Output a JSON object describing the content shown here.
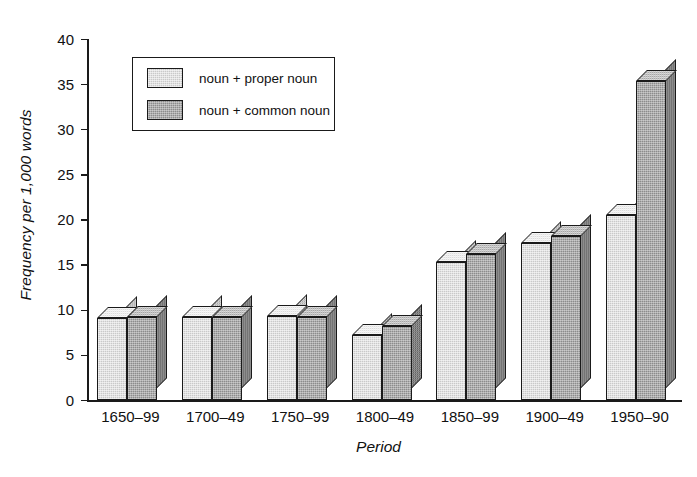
{
  "chart_data": {
    "type": "bar",
    "title": "",
    "xlabel": "Period",
    "ylabel": "Frequency per 1,000 words",
    "ylim": [
      0,
      40
    ],
    "yticks": [
      0,
      5,
      10,
      15,
      20,
      25,
      30,
      35,
      40
    ],
    "ytick_labels": [
      "0",
      "5",
      "10",
      "15",
      "20",
      "25",
      "30",
      "35",
      "40"
    ],
    "grid": false,
    "legend_position": "upper left",
    "categories": [
      "1650–99",
      "1700–49",
      "1750–99",
      "1800–49",
      "1850–99",
      "1900–49",
      "1950–90"
    ],
    "series": [
      {
        "name": "noun + proper noun",
        "color": "#c9c9c9",
        "values": [
          9.1,
          9.3,
          9.4,
          7.3,
          15.3,
          17.4,
          20.5
        ]
      },
      {
        "name": "noun + common noun",
        "color": "#8c8c8c",
        "values": [
          9.2,
          9.2,
          9.2,
          8.2,
          16.2,
          18.2,
          35.4
        ]
      }
    ]
  },
  "legend": {
    "items": [
      {
        "label": "noun + proper noun",
        "swatch": "light-gray"
      },
      {
        "label": "noun + common noun",
        "swatch": "dark-gray"
      }
    ]
  },
  "axes": {
    "y_title": "Frequency per 1,000 words",
    "x_title": "Period"
  }
}
